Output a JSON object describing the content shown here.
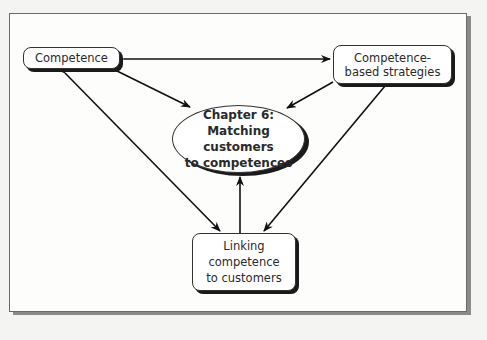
{
  "diagram": {
    "nodes": {
      "competence": {
        "label": "Competence"
      },
      "strategies": {
        "label": "Competence-based strategies"
      },
      "center": {
        "line1": "Chapter 6:",
        "line2": "Matching customers",
        "line3": "to competences"
      },
      "linking": {
        "label": "Linking competence to customers"
      }
    },
    "edges": [
      {
        "from": "competence",
        "to": "strategies",
        "type": "bidirectional"
      },
      {
        "from": "competence",
        "to": "center",
        "type": "directed"
      },
      {
        "from": "strategies",
        "to": "center",
        "type": "directed"
      },
      {
        "from": "competence",
        "to": "linking",
        "type": "bidirectional"
      },
      {
        "from": "strategies",
        "to": "linking",
        "type": "bidirectional"
      },
      {
        "from": "linking",
        "to": "center",
        "type": "directed"
      }
    ]
  }
}
